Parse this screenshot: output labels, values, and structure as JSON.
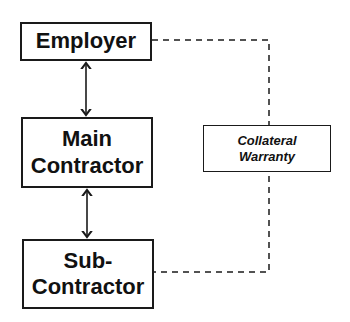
{
  "diagram": {
    "nodes": [
      {
        "id": "employer",
        "lines": [
          "Employer"
        ]
      },
      {
        "id": "main_contractor",
        "lines": [
          "Main",
          "Contractor"
        ]
      },
      {
        "id": "sub_contractor",
        "lines": [
          "Sub-",
          "Contractor"
        ]
      },
      {
        "id": "collateral_warranty",
        "lines": [
          "Collateral",
          "Warranty"
        ]
      }
    ],
    "edges": [
      {
        "from": "employer",
        "to": "main_contractor",
        "style": "solid",
        "arrows": "both"
      },
      {
        "from": "main_contractor",
        "to": "sub_contractor",
        "style": "solid",
        "arrows": "both"
      },
      {
        "from": "employer",
        "to": "sub_contractor",
        "style": "dashed",
        "via": "collateral_warranty"
      }
    ],
    "colors": {
      "stroke": "#1a1a1a",
      "background": "#ffffff"
    }
  }
}
